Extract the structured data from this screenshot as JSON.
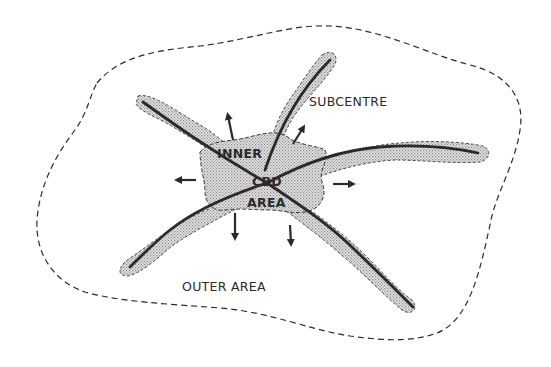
{
  "diagram": {
    "type": "urban-structure-schematic",
    "labels": {
      "subcentre": "SUBCENTRE",
      "inner": "INNER",
      "cbd": "CBD",
      "area": "AREA",
      "outer_area": "OUTER AREA"
    },
    "regions": [
      {
        "name": "CBD / inner area",
        "style": "stippled grey, dashed outline"
      },
      {
        "name": "outer area",
        "style": "white, dashed outline"
      }
    ],
    "corridors": [
      {
        "direction": "north-west"
      },
      {
        "direction": "north-east",
        "label": "SUBCENTRE"
      },
      {
        "direction": "east"
      },
      {
        "direction": "south-west"
      },
      {
        "direction": "south-east"
      }
    ],
    "expansion_arrows": 6,
    "colors": {
      "line": "#2a2a2a",
      "fill": "#d6d6d6",
      "background": "#ffffff"
    }
  }
}
